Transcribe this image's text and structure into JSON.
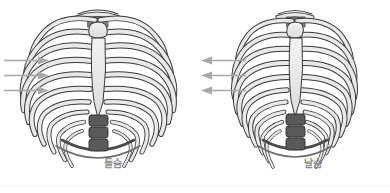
{
  "figure": {
    "title": "",
    "background_color": "#ffffff",
    "width": 390,
    "height": 193
  },
  "palette": {
    "bone_light": "#e9e9e9",
    "bone_mid": "#cfcfcf",
    "bone_dark": "#6e6e6e",
    "vertebra_dark": "#5a5a5a",
    "outline": "#3a3a3a",
    "arrow_gray": "#a8a8a8",
    "label_gray": "#8d8d8d",
    "baseline_gray": "#eeeeee"
  },
  "panels": [
    {
      "id": "inhale",
      "label": "들숨",
      "arrow_direction": "right",
      "arrow_count": 3,
      "rib_count": 10,
      "description": "expanded-ribcage"
    },
    {
      "id": "exhale",
      "label": "날숨",
      "arrow_direction": "left",
      "arrow_count": 3,
      "rib_count": 10,
      "description": "contracted-ribcage"
    }
  ]
}
